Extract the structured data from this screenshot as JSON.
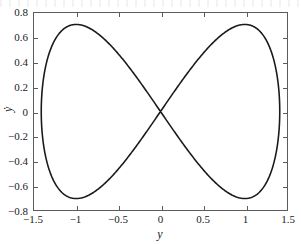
{
  "chart_data": {
    "type": "line",
    "title": "",
    "subtitle": "",
    "xlabel": "y",
    "ylabel": "ẏ",
    "xlim": [
      -1.5,
      1.5
    ],
    "ylim": [
      -0.8,
      0.8
    ],
    "xticks": [
      -1.5,
      -1,
      -0.5,
      0,
      0.5,
      1,
      1.5
    ],
    "xtick_labels": [
      "−1.5",
      "−1",
      "−0.5",
      "0",
      "0.5",
      "1",
      "1.5"
    ],
    "yticks": [
      0.8,
      0.6,
      0.4,
      0.2,
      0,
      -0.2,
      -0.4,
      -0.6,
      -0.8
    ],
    "ytick_labels": [
      "0.8",
      "0.6",
      "0.4",
      "0.2",
      "0",
      "−0.2",
      "−0.4",
      "−0.6",
      "−0.8"
    ],
    "grid": false,
    "legend": null,
    "legend_position": "none",
    "line_color": "#1a1a1a",
    "line_width": 1.6,
    "frame_color": "#5b5b5b",
    "background_color": "#ffffff",
    "annotations": [],
    "series": [
      {
        "name": "figure-eight orbit",
        "closed": true,
        "x_extrema": [
          -1.414,
          1.414
        ],
        "y_extrema": [
          -0.707,
          0.707
        ],
        "key_points": [
          {
            "x": 0.0,
            "y": 0.0,
            "note": "self-intersection at origin"
          },
          {
            "x": -1.0,
            "y": 0.707,
            "note": "left lobe upper peak"
          },
          {
            "x": -1.0,
            "y": -0.707,
            "note": "left lobe lower trough"
          },
          {
            "x": 1.0,
            "y": 0.707,
            "note": "right lobe upper peak"
          },
          {
            "x": 1.0,
            "y": -0.707,
            "note": "right lobe lower trough"
          },
          {
            "x": -1.414,
            "y": 0.0,
            "note": "leftmost turning point"
          },
          {
            "x": 1.414,
            "y": 0.0,
            "note": "rightmost turning point"
          }
        ],
        "x": [
          0,
          0.0785,
          0.1566,
          0.2341,
          0.3105,
          0.3857,
          0.4593,
          0.5311,
          0.6008,
          0.6682,
          0.7331,
          0.7952,
          0.8544,
          0.9104,
          0.9631,
          1.0123,
          1.058,
          1.0999,
          1.138,
          1.1722,
          1.2024,
          1.2287,
          1.2509,
          1.269,
          1.2831,
          1.2931,
          1.2991,
          1.3011,
          1.2991,
          1.2931,
          1.2831,
          1.269,
          1.2509,
          1.2287,
          1.2024,
          1.1722,
          1.138,
          1.0999,
          1.058,
          1.0123,
          0.9631,
          0.9104,
          0.8544,
          0.7952,
          0.7331,
          0.6682,
          0.6008,
          0.5311,
          0.4593,
          0.3857,
          0.3105,
          0.2341,
          0.1566,
          0.0785,
          0
        ],
        "y": [
          0,
          0.0781,
          0.1545,
          0.2275,
          0.2955,
          0.3572,
          0.4114,
          0.4573,
          0.4942,
          0.5219,
          0.5402,
          0.5492,
          0.5492,
          0.5405,
          0.5238,
          0.4996,
          0.4688,
          0.4322,
          0.3908,
          0.3456,
          0.2976,
          0.2478,
          0.1972,
          0.1468,
          0.0974,
          0.0497,
          0.0045,
          -0.0376,
          -0.0762,
          -0.1107,
          -0.1409,
          -0.1664,
          -0.1871,
          -0.2029,
          -0.2138,
          -0.2198,
          -0.2211,
          -0.2179,
          -0.2104,
          -0.199,
          -0.184,
          -0.1658,
          -0.145,
          -0.1219,
          -0.0971,
          -0.0711,
          -0.0444,
          -0.0176,
          0.0089,
          0.0345,
          0.0588,
          0.0813,
          0.1016,
          0.1193,
          0.1342
        ]
      }
    ]
  },
  "axes": {
    "x_ticks": [
      {
        "value": -1.5,
        "label": "−1.5"
      },
      {
        "value": -1,
        "label": "−1"
      },
      {
        "value": -0.5,
        "label": "−0.5"
      },
      {
        "value": 0,
        "label": "0"
      },
      {
        "value": 0.5,
        "label": "0.5"
      },
      {
        "value": 1,
        "label": "1"
      },
      {
        "value": 1.5,
        "label": "1.5"
      }
    ],
    "y_ticks": [
      {
        "value": 0.8,
        "label": "0.8"
      },
      {
        "value": 0.6,
        "label": "0.6"
      },
      {
        "value": 0.4,
        "label": "0.4"
      },
      {
        "value": 0.2,
        "label": "0.2"
      },
      {
        "value": 0,
        "label": "0"
      },
      {
        "value": -0.2,
        "label": "−0.2"
      },
      {
        "value": -0.4,
        "label": "−0.4"
      },
      {
        "value": -0.6,
        "label": "−0.6"
      },
      {
        "value": -0.8,
        "label": "−0.8"
      }
    ],
    "x_axis_title": "y",
    "y_axis_title": "ẏ"
  }
}
